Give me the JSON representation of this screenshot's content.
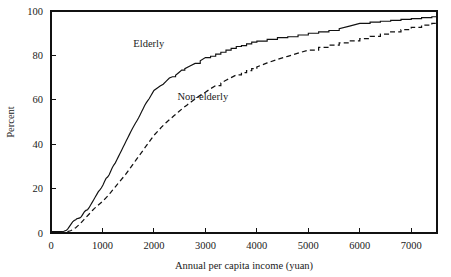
{
  "chart_data": {
    "type": "line",
    "title": "",
    "subtitle": "",
    "xlabel": "Annual per capita income (yuan)",
    "ylabel": "Percent",
    "xlim": [
      0,
      7500
    ],
    "ylim": [
      0,
      100
    ],
    "grid": false,
    "legend_position": "inline-annotation",
    "xticks": [
      0,
      1000,
      2000,
      3000,
      4000,
      5000,
      6000,
      7000
    ],
    "xtick_labels": [
      "0",
      "1000",
      "2000",
      "3000",
      "4000",
      "5000",
      "6000",
      "7000"
    ],
    "yticks": [
      0,
      20,
      40,
      60,
      80,
      100
    ],
    "ytick_labels": [
      "0",
      "20",
      "40",
      "60",
      "80",
      "100"
    ],
    "annotations": [
      {
        "text": "Elderly",
        "x": 1900,
        "y": 84,
        "series": "Elderly"
      },
      {
        "text": "Non-elderly",
        "x": 2950,
        "y": 60,
        "series": "Non-elderly"
      }
    ],
    "series": [
      {
        "name": "Elderly",
        "style": "solid",
        "color": "#111111",
        "x": [
          0,
          150,
          250,
          300,
          330,
          360,
          390,
          420,
          450,
          480,
          500,
          530,
          560,
          590,
          620,
          650,
          680,
          710,
          740,
          770,
          800,
          830,
          860,
          890,
          920,
          950,
          980,
          1010,
          1040,
          1070,
          1100,
          1130,
          1160,
          1190,
          1220,
          1250,
          1280,
          1310,
          1340,
          1370,
          1400,
          1430,
          1460,
          1490,
          1520,
          1550,
          1580,
          1610,
          1640,
          1670,
          1700,
          1730,
          1760,
          1790,
          1820,
          1850,
          1880,
          1910,
          1940,
          1970,
          2000,
          2060,
          2120,
          2180,
          2240,
          2300,
          2360,
          2420,
          2480,
          2540,
          2600,
          2700,
          2800,
          2900,
          3000,
          3100,
          3200,
          3300,
          3400,
          3500,
          3600,
          3700,
          3800,
          3900,
          4000,
          4200,
          4400,
          4600,
          4800,
          5000,
          5200,
          5400,
          5600,
          5800,
          6000,
          6200,
          6400,
          6600,
          6800,
          7000,
          7200,
          7400,
          7500
        ],
        "y": [
          0.6,
          0.6,
          0.8,
          1.2,
          2.0,
          3.0,
          4.0,
          5.0,
          5.6,
          6.0,
          6.4,
          6.6,
          6.8,
          7.4,
          8.5,
          9.6,
          10.2,
          10.5,
          11.4,
          12.6,
          13.8,
          15.0,
          16.2,
          17.4,
          18.6,
          19.4,
          20.4,
          21.6,
          23.2,
          24.6,
          25.2,
          26.2,
          27.8,
          29.4,
          30.6,
          31.6,
          33.0,
          34.4,
          35.8,
          37.2,
          38.6,
          40.0,
          41.4,
          42.8,
          44.2,
          45.6,
          47.0,
          48.2,
          49.4,
          50.6,
          51.8,
          53.2,
          54.6,
          56.0,
          57.4,
          58.6,
          59.6,
          60.6,
          61.8,
          63.0,
          64.2,
          65.2,
          66.2,
          67.0,
          68.4,
          69.8,
          70.4,
          71.0,
          72.2,
          73.4,
          74.0,
          75.2,
          76.4,
          77.6,
          79.0,
          79.6,
          80.6,
          81.4,
          82.4,
          83.2,
          84.0,
          84.4,
          85.2,
          86.0,
          86.4,
          87.2,
          88.0,
          88.4,
          89.2,
          90.0,
          90.6,
          91.2,
          92.0,
          93.2,
          94.4,
          95.0,
          95.4,
          95.8,
          96.2,
          96.6,
          97.0,
          97.4,
          97.6
        ]
      },
      {
        "name": "Non-elderly",
        "style": "dashed",
        "color": "#111111",
        "x": [
          0,
          200,
          320,
          380,
          430,
          480,
          520,
          560,
          600,
          640,
          680,
          720,
          760,
          800,
          840,
          880,
          920,
          960,
          1000,
          1050,
          1100,
          1150,
          1200,
          1250,
          1300,
          1350,
          1400,
          1450,
          1500,
          1550,
          1600,
          1650,
          1700,
          1750,
          1800,
          1850,
          1900,
          1950,
          2000,
          2080,
          2160,
          2240,
          2320,
          2400,
          2480,
          2560,
          2640,
          2720,
          2800,
          2900,
          3000,
          3100,
          3200,
          3300,
          3400,
          3500,
          3600,
          3700,
          3800,
          3900,
          4000,
          4200,
          4400,
          4600,
          4800,
          5000,
          5200,
          5400,
          5600,
          5800,
          6000,
          6200,
          6400,
          6600,
          6800,
          7000,
          7200,
          7400,
          7500
        ],
        "y": [
          0.4,
          0.4,
          0.6,
          1.0,
          1.6,
          2.4,
          3.2,
          4.0,
          5.0,
          6.0,
          7.0,
          8.0,
          9.0,
          10.0,
          11.0,
          11.8,
          12.6,
          13.4,
          14.2,
          15.4,
          16.6,
          18.0,
          19.4,
          20.8,
          22.2,
          23.6,
          25.0,
          26.4,
          28.0,
          29.6,
          31.2,
          32.8,
          34.4,
          36.0,
          37.6,
          39.2,
          40.8,
          42.4,
          44.0,
          46.0,
          48.0,
          49.8,
          51.4,
          53.0,
          54.6,
          56.2,
          57.6,
          59.0,
          60.4,
          62.0,
          63.4,
          65.0,
          66.4,
          67.6,
          68.8,
          70.0,
          71.2,
          72.2,
          73.2,
          74.0,
          74.8,
          76.6,
          78.2,
          79.6,
          81.0,
          82.4,
          83.6,
          84.6,
          85.6,
          86.6,
          87.6,
          88.6,
          89.6,
          90.6,
          91.6,
          92.6,
          93.6,
          94.4,
          94.8
        ]
      }
    ]
  }
}
